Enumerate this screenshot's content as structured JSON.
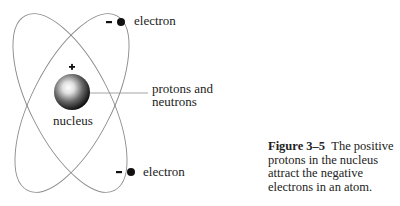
{
  "figure": {
    "labels": {
      "electron_top": "electron",
      "electron_bottom": "electron",
      "nucleus": "nucleus",
      "protons_neutrons_line1": "protons and",
      "protons_neutrons_line2": "neutrons",
      "nucleus_charge": "+",
      "electron_top_charge": "–",
      "electron_bottom_charge": "–"
    },
    "caption": {
      "number": "Figure 3–5",
      "text": "The positive protons in the nucleus attract the negative electrons in an atom."
    },
    "colors": {
      "orbit": "#8a8a8a",
      "electron": "#111111",
      "text": "#222222",
      "leader_line": "#9a9a9a"
    }
  }
}
